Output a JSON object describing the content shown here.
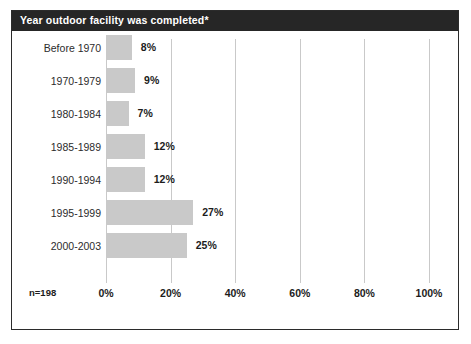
{
  "card": {
    "title": "Year outdoor facility was completed*",
    "sample_size_label": "n=198",
    "border_color": "#2b2b2b",
    "title_bar_color": "#262626",
    "title_text_color": "#ffffff",
    "background_color": "#ffffff"
  },
  "chart_data": {
    "type": "bar",
    "orientation": "horizontal",
    "title": "Year outdoor facility was completed*",
    "xlabel": "",
    "ylabel": "",
    "categories": [
      "Before 1970",
      "1970-1979",
      "1980-1984",
      "1985-1989",
      "1990-1994",
      "1995-1999",
      "2000-2003"
    ],
    "values": [
      8,
      9,
      7,
      12,
      12,
      27,
      25
    ],
    "value_labels": [
      "8%",
      "9%",
      "7%",
      "12%",
      "12%",
      "27%",
      "25%"
    ],
    "xlim": [
      0,
      100
    ],
    "xticks": [
      0,
      20,
      40,
      60,
      80,
      100
    ],
    "xtick_labels": [
      "0%",
      "20%",
      "40%",
      "60%",
      "80%",
      "100%"
    ],
    "grid": true,
    "grid_axis": "x",
    "grid_color": "#c9c9c9",
    "legend": false,
    "bar_color": "#c9c9c9",
    "annotation": "n=198",
    "footnote_marker": "*"
  }
}
